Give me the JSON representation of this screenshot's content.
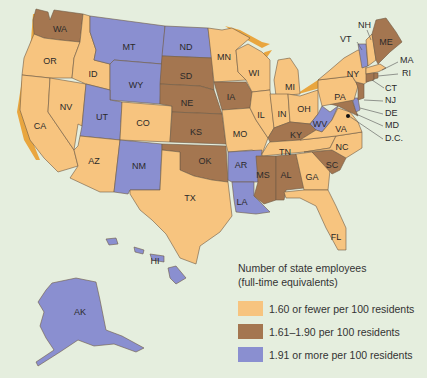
{
  "legend": {
    "title_line1": "Number of state employees",
    "title_line2": "(full-time equivalents)",
    "items": [
      {
        "label": "1.60 or fewer per 100 residents",
        "color": "#f7c47f",
        "category": "low"
      },
      {
        "label": "1.61–1.90 per 100 residents",
        "color": "#a47650",
        "category": "mid"
      },
      {
        "label": "1.91 or more per 100 residents",
        "color": "#8a8fd0",
        "category": "high"
      }
    ]
  },
  "colors": {
    "background": "#e5eede",
    "low": "#f7c47f",
    "mid": "#a47650",
    "high": "#8a8fd0",
    "coast_shadow": "#e9a63f"
  },
  "states": {
    "WA": "mid",
    "OR": "low",
    "CA": "low",
    "ID": "low",
    "NV": "low",
    "MT": "high",
    "WY": "high",
    "UT": "high",
    "CO": "low",
    "AZ": "low",
    "NM": "high",
    "ND": "high",
    "SD": "mid",
    "NE": "mid",
    "KS": "mid",
    "OK": "mid",
    "TX": "low",
    "MN": "low",
    "IA": "mid",
    "MO": "low",
    "AR": "high",
    "LA": "high",
    "WI": "low",
    "IL": "low",
    "MI": "low",
    "IN": "low",
    "OH": "low",
    "KY": "mid",
    "TN": "low",
    "MS": "mid",
    "AL": "mid",
    "GA": "low",
    "FL": "low",
    "SC": "mid",
    "NC": "low",
    "VA": "low",
    "WV": "high",
    "PA": "low",
    "NY": "low",
    "VT": "high",
    "NH": "low",
    "ME": "mid",
    "MA": "low",
    "RI": "mid",
    "CT": "mid",
    "NJ": "mid",
    "DE": "high",
    "MD": "mid",
    "DC": "mid",
    "AK": "high",
    "HI": "high"
  },
  "labels": {
    "WA": "WA",
    "OR": "OR",
    "CA": "CA",
    "ID": "ID",
    "NV": "NV",
    "MT": "MT",
    "WY": "WY",
    "UT": "UT",
    "CO": "CO",
    "AZ": "AZ",
    "NM": "NM",
    "ND": "ND",
    "SD": "SD",
    "NE": "NE",
    "KS": "KS",
    "OK": "OK",
    "TX": "TX",
    "MN": "MN",
    "IA": "IA",
    "MO": "MO",
    "AR": "AR",
    "LA": "LA",
    "WI": "WI",
    "IL": "IL",
    "MI": "MI",
    "IN": "IN",
    "OH": "OH",
    "KY": "KY",
    "TN": "TN",
    "MS": "MS",
    "AL": "AL",
    "GA": "GA",
    "FL": "FL",
    "SC": "SC",
    "NC": "NC",
    "VA": "VA",
    "WV": "WV",
    "PA": "PA",
    "NY": "NY",
    "VT": "VT",
    "NH": "NH",
    "ME": "ME",
    "MA": "MA",
    "RI": "RI",
    "CT": "CT",
    "NJ": "NJ",
    "DE": "DE",
    "MD": "MD",
    "DC": "D.C.",
    "AK": "AK",
    "HI": "HI"
  }
}
